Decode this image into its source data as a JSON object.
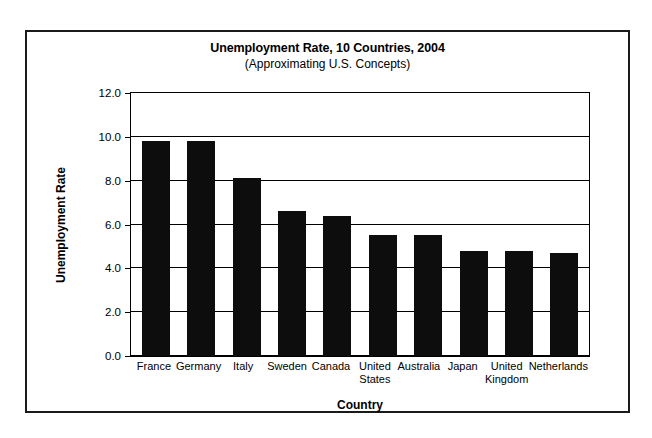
{
  "chart_data": {
    "type": "bar",
    "title": "Unemployment Rate, 10 Countries, 2004",
    "subtitle": "(Approximating U.S. Concepts)",
    "xlabel": "Country",
    "ylabel": "Unemployment Rate",
    "categories": [
      "France",
      "Germany",
      "Italy",
      "Sweden",
      "Canada",
      "United States",
      "Australia",
      "Japan",
      "United Kingdom",
      "Netherlands"
    ],
    "values": [
      9.8,
      9.8,
      8.1,
      6.6,
      6.4,
      5.5,
      5.5,
      4.8,
      4.8,
      4.7
    ],
    "ylim": [
      0.0,
      12.0
    ],
    "yticks": [
      "0.0",
      "2.0",
      "4.0",
      "6.0",
      "8.0",
      "10.0",
      "12.0"
    ],
    "ytick_values": [
      0.0,
      2.0,
      4.0,
      6.0,
      8.0,
      10.0,
      12.0
    ],
    "grid": true,
    "legend": null,
    "bar_color": "#0d0d0d",
    "axis_color": "#000000",
    "background": "#ffffff"
  }
}
